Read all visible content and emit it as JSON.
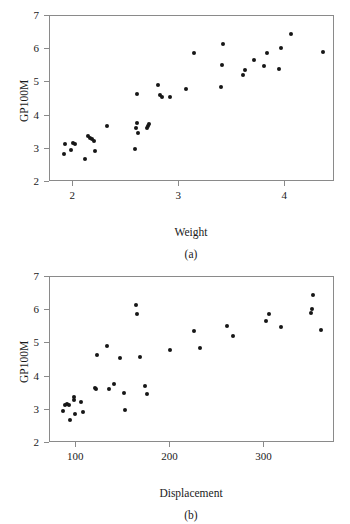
{
  "figure": {
    "panels": [
      {
        "caption": "(a)",
        "ylabel": "GP100M",
        "xlabel": "Weight"
      },
      {
        "caption": "(b)",
        "ylabel": "GP100M",
        "xlabel": "Displacement"
      }
    ],
    "marker_color": "#161616",
    "frame_color": "#8a8a8a"
  },
  "chart_data": [
    {
      "type": "scatter",
      "title": "",
      "subtitle": "(a)",
      "xlabel": "Weight",
      "ylabel": "GP100M",
      "xlim": [
        1.78,
        4.47
      ],
      "ylim": [
        2,
        7
      ],
      "xticks": [
        2,
        3,
        4
      ],
      "yticks": [
        2,
        3,
        4,
        5,
        6,
        7
      ],
      "xtick_labels": [
        "2",
        "3",
        "4"
      ],
      "ytick_labels": [
        "2",
        "3",
        "4",
        "5",
        "6",
        "7"
      ],
      "grid": false,
      "legend": null,
      "points": [
        {
          "x": 1.915,
          "y": 2.85
        },
        {
          "x": 1.925,
          "y": 3.14
        },
        {
          "x": 1.975,
          "y": 2.95
        },
        {
          "x": 1.995,
          "y": 3.18
        },
        {
          "x": 2.015,
          "y": 3.15
        },
        {
          "x": 2.115,
          "y": 2.69
        },
        {
          "x": 2.135,
          "y": 3.39
        },
        {
          "x": 2.155,
          "y": 3.33
        },
        {
          "x": 2.175,
          "y": 3.3
        },
        {
          "x": 2.195,
          "y": 3.24
        },
        {
          "x": 2.205,
          "y": 2.94
        },
        {
          "x": 2.315,
          "y": 3.68
        },
        {
          "x": 2.58,
          "y": 3.0
        },
        {
          "x": 2.59,
          "y": 3.64
        },
        {
          "x": 2.6,
          "y": 3.78
        },
        {
          "x": 2.605,
          "y": 4.65
        },
        {
          "x": 2.615,
          "y": 3.47
        },
        {
          "x": 2.695,
          "y": 3.62
        },
        {
          "x": 2.705,
          "y": 3.7
        },
        {
          "x": 2.715,
          "y": 3.75
        },
        {
          "x": 2.8,
          "y": 4.92
        },
        {
          "x": 2.82,
          "y": 4.62
        },
        {
          "x": 2.84,
          "y": 4.55
        },
        {
          "x": 2.91,
          "y": 4.57
        },
        {
          "x": 3.06,
          "y": 4.81
        },
        {
          "x": 3.14,
          "y": 5.88
        },
        {
          "x": 3.39,
          "y": 4.85
        },
        {
          "x": 3.4,
          "y": 5.52
        },
        {
          "x": 3.41,
          "y": 6.16
        },
        {
          "x": 3.6,
          "y": 5.22
        },
        {
          "x": 3.62,
          "y": 5.37
        },
        {
          "x": 3.71,
          "y": 5.67
        },
        {
          "x": 3.8,
          "y": 5.48
        },
        {
          "x": 3.83,
          "y": 5.88
        },
        {
          "x": 3.94,
          "y": 5.4
        },
        {
          "x": 3.96,
          "y": 6.05
        },
        {
          "x": 4.05,
          "y": 6.45
        },
        {
          "x": 4.36,
          "y": 5.91
        }
      ]
    },
    {
      "type": "scatter",
      "title": "",
      "subtitle": "(b)",
      "xlabel": "Displacement",
      "ylabel": "GP100M",
      "xlim": [
        72,
        375
      ],
      "ylim": [
        2,
        7
      ],
      "xticks": [
        100,
        200,
        300
      ],
      "yticks": [
        2,
        3,
        4,
        5,
        6,
        7
      ],
      "xtick_labels": [
        "100",
        "200",
        "300"
      ],
      "ytick_labels": [
        "2",
        "3",
        "4",
        "5",
        "6",
        "7"
      ],
      "grid": false,
      "legend": null,
      "points": [
        {
          "x": 86,
          "y": 2.95
        },
        {
          "x": 88,
          "y": 3.15
        },
        {
          "x": 90,
          "y": 3.16
        },
        {
          "x": 92,
          "y": 3.14
        },
        {
          "x": 93,
          "y": 2.69
        },
        {
          "x": 97,
          "y": 3.38
        },
        {
          "x": 98,
          "y": 3.3
        },
        {
          "x": 99,
          "y": 2.87
        },
        {
          "x": 105,
          "y": 3.24
        },
        {
          "x": 107,
          "y": 2.93
        },
        {
          "x": 120,
          "y": 3.67
        },
        {
          "x": 121,
          "y": 3.62
        },
        {
          "x": 122,
          "y": 4.65
        },
        {
          "x": 133,
          "y": 4.93
        },
        {
          "x": 135,
          "y": 3.62
        },
        {
          "x": 140,
          "y": 3.78
        },
        {
          "x": 146,
          "y": 4.55
        },
        {
          "x": 151,
          "y": 3.52
        },
        {
          "x": 152,
          "y": 2.99
        },
        {
          "x": 163,
          "y": 6.16
        },
        {
          "x": 165,
          "y": 5.88
        },
        {
          "x": 168,
          "y": 4.58
        },
        {
          "x": 173,
          "y": 3.72
        },
        {
          "x": 175,
          "y": 3.47
        },
        {
          "x": 200,
          "y": 4.81
        },
        {
          "x": 225,
          "y": 5.37
        },
        {
          "x": 231,
          "y": 4.85
        },
        {
          "x": 260,
          "y": 5.52
        },
        {
          "x": 267,
          "y": 5.22
        },
        {
          "x": 302,
          "y": 5.67
        },
        {
          "x": 305,
          "y": 5.88
        },
        {
          "x": 318,
          "y": 5.48
        },
        {
          "x": 350,
          "y": 5.91
        },
        {
          "x": 351,
          "y": 6.05
        },
        {
          "x": 352,
          "y": 6.45
        },
        {
          "x": 360,
          "y": 5.4
        }
      ]
    }
  ]
}
